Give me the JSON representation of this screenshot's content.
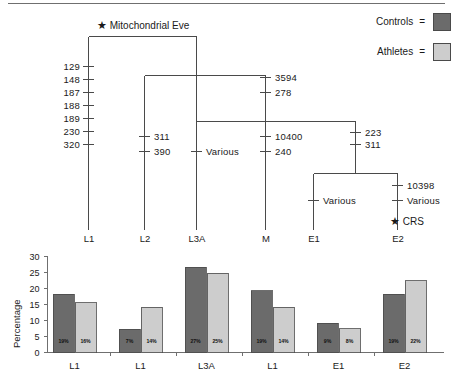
{
  "figure": {
    "top_rule": true
  },
  "tree": {
    "root_star": "★",
    "root_label": "Mitochondrial Eve",
    "crs_star": "★",
    "crs_label": "CRS",
    "axis_labels": [
      "L1",
      "L2",
      "L3A",
      "M",
      "E1",
      "E2"
    ],
    "branches": [
      {
        "name": "L1",
        "values": [
          "129",
          "148",
          "187",
          "188",
          "189",
          "230",
          "320"
        ]
      },
      {
        "name": "L2",
        "values": [
          "311",
          "390"
        ]
      },
      {
        "name": "L3A",
        "values": [
          "Various"
        ]
      },
      {
        "name": "M",
        "values": [
          "3594",
          "278",
          "10400",
          "240"
        ]
      },
      {
        "name": "E-trunk",
        "values": [
          "223",
          "311"
        ]
      },
      {
        "name": "E1",
        "values": [
          "Various"
        ]
      },
      {
        "name": "E2",
        "values": [
          "10398",
          "Various"
        ]
      }
    ]
  },
  "legend": {
    "items": [
      {
        "label": "Controls",
        "equals": "=",
        "color": "#6b6b6b"
      },
      {
        "label": "Athletes",
        "equals": "=",
        "color": "#cdcdcd"
      }
    ]
  },
  "chart_data": {
    "type": "bar",
    "title": "",
    "xlabel": "",
    "ylabel": "Percentage",
    "ylim": [
      0,
      30
    ],
    "yticks": [
      0,
      5,
      10,
      15,
      20,
      25,
      30
    ],
    "grid": false,
    "legend_position": "top-right",
    "categories": [
      "L1",
      "L1",
      "L3A",
      "L1",
      "E1",
      "E2"
    ],
    "series": [
      {
        "name": "Controls",
        "color": "#6b6b6b",
        "values": [
          18.2,
          7.3,
          26.6,
          19.3,
          9.2,
          18.2
        ],
        "data_labels": [
          "19%",
          "7%",
          "27%",
          "19%",
          "9%",
          "19%"
        ]
      },
      {
        "name": "Athletes",
        "color": "#cdcdcd",
        "values": [
          15.6,
          14.2,
          24.8,
          14.2,
          7.4,
          22.4
        ],
        "data_labels": [
          "16%",
          "14%",
          "25%",
          "14%",
          "8%",
          "22%"
        ]
      }
    ]
  }
}
